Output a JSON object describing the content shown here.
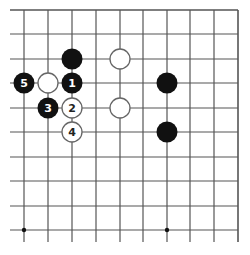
{
  "diagram": {
    "type": "go-board-fragment",
    "grid": {
      "columns_x": [
        24,
        48,
        72,
        96,
        120,
        143,
        167,
        190,
        214,
        238
      ],
      "rows_y": [
        10,
        34,
        59,
        83,
        108,
        132,
        157,
        181,
        206,
        230
      ],
      "line_color": "#555555",
      "top_border": true,
      "right_border": true,
      "left_extends_to": 10,
      "bottom_extends_to": 242
    },
    "star_points": [
      {
        "col": 0,
        "row": 9
      },
      {
        "col": 6,
        "row": 9
      }
    ],
    "stones": [
      {
        "color": "black",
        "col": 2,
        "row": 2,
        "label": ""
      },
      {
        "color": "white",
        "col": 4,
        "row": 2,
        "label": ""
      },
      {
        "color": "black",
        "col": 0,
        "row": 3,
        "label": "5"
      },
      {
        "color": "white",
        "col": 1,
        "row": 3,
        "label": ""
      },
      {
        "color": "black",
        "col": 2,
        "row": 3,
        "label": "1"
      },
      {
        "color": "black",
        "col": 6,
        "row": 3,
        "label": ""
      },
      {
        "color": "black",
        "col": 1,
        "row": 4,
        "label": "3"
      },
      {
        "color": "white",
        "col": 2,
        "row": 4,
        "label": "2"
      },
      {
        "color": "white",
        "col": 4,
        "row": 4,
        "label": ""
      },
      {
        "color": "white",
        "col": 2,
        "row": 5,
        "label": "4"
      },
      {
        "color": "black",
        "col": 6,
        "row": 5,
        "label": ""
      }
    ],
    "colors": {
      "black_stone": "#111111",
      "white_stone_fill": "#ffffff",
      "white_stone_stroke": "#666666",
      "label_on_black": "#ffffff",
      "label_on_white": "#222222"
    }
  }
}
